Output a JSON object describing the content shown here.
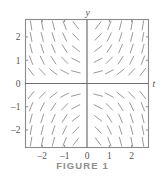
{
  "figure": {
    "caption": "FIGURE 1",
    "axis_label_x": "t",
    "axis_label_y": "y",
    "colors": {
      "frame": "#8a8a8a",
      "axis": "#6e6e6e",
      "slope": "#9a9a9a",
      "tick": "#8a8a8a",
      "label": "#555555",
      "caption": "#8d8d8d",
      "background": "#ffffff"
    }
  },
  "chart_data": {
    "type": "scatter",
    "subtype": "slope-field",
    "title": "",
    "subtitle": "",
    "xlabel": "t",
    "ylabel": "y",
    "xlim": [
      -2.75,
      2.75
    ],
    "ylim": [
      -2.75,
      2.75
    ],
    "xticks": [
      -2,
      -1,
      0,
      1,
      2
    ],
    "yticks": [
      -2,
      -1,
      0,
      1,
      2
    ],
    "xticklabels": [
      "-2",
      "-1",
      "0",
      "1",
      "2"
    ],
    "yticklabels": [
      "-2",
      "-1",
      "0",
      "1",
      "2"
    ],
    "grid": false,
    "legend": null,
    "legend_position": "none",
    "equation": "y' = t*y",
    "segment_length": 9.0,
    "grid_x": [
      -2.5,
      -2.0,
      -1.5,
      -1.0,
      -0.5,
      0.5,
      1.0,
      1.5,
      2.0,
      2.5
    ],
    "grid_y": [
      2.5,
      2.0,
      1.5,
      1.0,
      0.5,
      -0.5,
      -1.0,
      -1.5,
      -2.0,
      -2.5
    ],
    "slopes": [
      [
        -6.25,
        -5.0,
        -3.75,
        -2.5,
        -1.25,
        1.25,
        2.5,
        3.75,
        5.0,
        6.25
      ],
      [
        -5.0,
        -4.0,
        -3.0,
        -2.0,
        -1.0,
        1.0,
        2.0,
        3.0,
        4.0,
        5.0
      ],
      [
        -3.75,
        -3.0,
        -2.25,
        -1.5,
        -0.75,
        0.75,
        1.5,
        2.25,
        3.0,
        3.75
      ],
      [
        -2.5,
        -2.0,
        -1.5,
        -1.0,
        -0.5,
        0.5,
        1.0,
        1.5,
        2.0,
        2.5
      ],
      [
        -1.25,
        -1.0,
        -0.75,
        -0.5,
        -0.25,
        0.25,
        0.5,
        0.75,
        1.0,
        1.25
      ],
      [
        1.25,
        1.0,
        0.75,
        0.5,
        0.25,
        -0.25,
        -0.5,
        -0.75,
        -1.0,
        -1.25
      ],
      [
        2.5,
        2.0,
        1.5,
        1.0,
        0.5,
        -0.5,
        -1.0,
        -1.5,
        -2.0,
        -2.5
      ],
      [
        3.75,
        3.0,
        2.25,
        1.5,
        0.75,
        -0.75,
        -1.5,
        -2.25,
        -3.0,
        -3.75
      ],
      [
        5.0,
        4.0,
        3.0,
        2.0,
        1.0,
        -1.0,
        -2.0,
        -3.0,
        -4.0,
        -5.0
      ],
      [
        6.25,
        5.0,
        3.75,
        2.5,
        1.25,
        -1.25,
        -2.5,
        -3.75,
        -5.0,
        -6.25
      ]
    ]
  }
}
